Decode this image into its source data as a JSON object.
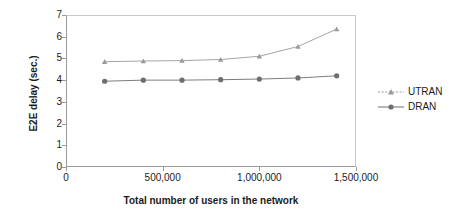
{
  "chart_data": {
    "type": "line",
    "title": "",
    "xlabel": "Total number of users in the network",
    "ylabel": "E2E delay (sec.)",
    "xlim": [
      0,
      1500000
    ],
    "ylim": [
      0,
      7
    ],
    "grid": false,
    "legend_position": "right",
    "x": [
      200000,
      400000,
      600000,
      800000,
      1000000,
      1200000,
      1400000
    ],
    "xticks": [
      "0",
      "500,000",
      "1,000,000",
      "1,500,000"
    ],
    "xtick_values": [
      0,
      500000,
      1000000,
      1500000
    ],
    "yticks": [
      "0",
      "1",
      "2",
      "3",
      "4",
      "5",
      "6",
      "7"
    ],
    "ytick_values": [
      0,
      1,
      2,
      3,
      4,
      5,
      6,
      7
    ],
    "series": [
      {
        "name": "UTRAN",
        "marker": "triangle",
        "color": "#9a9a9a",
        "values": [
          4.85,
          4.88,
          4.9,
          4.95,
          5.1,
          5.55,
          6.35
        ]
      },
      {
        "name": "DRAN",
        "marker": "circle",
        "color": "#6e6e6e",
        "values": [
          3.95,
          4.0,
          4.0,
          4.02,
          4.05,
          4.1,
          4.2
        ]
      }
    ]
  },
  "legend": {
    "items": [
      {
        "label": "UTRAN"
      },
      {
        "label": "DRAN"
      }
    ]
  }
}
